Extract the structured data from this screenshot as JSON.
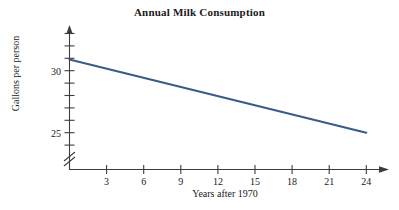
{
  "chart_data": {
    "type": "line",
    "title": "Annual Milk Consumption",
    "xlabel": "Years after 1970",
    "ylabel": "Gallons per person",
    "xlim": [
      0,
      26
    ],
    "ylim": [
      24,
      32
    ],
    "grid": false,
    "legend": null,
    "y_axis_break": true,
    "x_ticks": [
      3,
      6,
      9,
      12,
      15,
      18,
      21,
      24
    ],
    "x_tick_labels": [
      "3",
      "6",
      "9",
      "12",
      "15",
      "18",
      "21",
      "24"
    ],
    "y_ticks": [
      24,
      25,
      26,
      27,
      28,
      29,
      30,
      31,
      32
    ],
    "y_tick_labels": [
      "",
      "25",
      "",
      "",
      "",
      "",
      "30",
      "",
      ""
    ],
    "y_labeled_ticks": [
      {
        "value": 25,
        "label": "25"
      },
      {
        "value": 30,
        "label": "30"
      }
    ],
    "series": [
      {
        "name": "Milk consumption",
        "color": "#3c5a88",
        "x": [
          0,
          24
        ],
        "values": [
          30.9,
          25.0
        ],
        "points": [
          {
            "x": 0,
            "y": 30.9
          },
          {
            "x": 24,
            "y": 25.0
          }
        ]
      }
    ],
    "annotations": []
  },
  "colors": {
    "line": "#3c5a88",
    "axis": "#3d3d3d",
    "text": "#1a1a1a",
    "background": "#ffffff"
  }
}
